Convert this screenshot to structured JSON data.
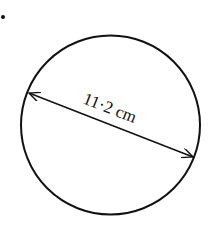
{
  "question_marker": "•",
  "diagram": {
    "shape": "circle",
    "measurement": {
      "type": "diameter",
      "value": "11·2",
      "unit": "cm",
      "label": "11·2 cm"
    },
    "colors": {
      "stroke": "#111111",
      "background": "#ffffff"
    }
  }
}
